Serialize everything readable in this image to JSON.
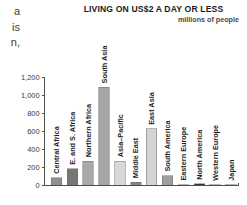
{
  "body_text_fragments": [
    "a",
    "is",
    "n,"
  ],
  "chart_data": {
    "type": "bar",
    "title": "LIVING ON US$2 A DAY OR LESS",
    "subtitle": "millions of people",
    "xlabel": "",
    "ylabel": "",
    "ylim": [
      0,
      1200
    ],
    "grid": false,
    "legend": "none",
    "ytick_labels": [
      "0",
      "200",
      "400",
      "600",
      "800",
      "1,000",
      "1,200"
    ],
    "ytick_values": [
      0,
      200,
      400,
      600,
      800,
      1000,
      1200
    ],
    "categories": [
      "Central Africa",
      "E. and S. Africa",
      "Northern Africa",
      "South Asia",
      "Asia–Pacific",
      "Middle East",
      "East Asia",
      "South America",
      "Eastern Europe",
      "North America",
      "Western Europe",
      "Japan"
    ],
    "values": [
      85,
      185,
      270,
      1090,
      270,
      35,
      630,
      110,
      10,
      20,
      3,
      1
    ],
    "bar_colors": [
      "#8f8f8f",
      "#777777",
      "#a8a8a8",
      "#a5a5a5",
      "#d8d8d8",
      "#858585",
      "#d4d4d4",
      "#9e9e9e",
      "#c4c4c4",
      "#3a3a3a",
      "#d0d0d0",
      "#d0d0d0"
    ]
  },
  "colors": {
    "axis": "#4d4d4d",
    "text": "#1e1e1e",
    "background": "#ffffff"
  }
}
